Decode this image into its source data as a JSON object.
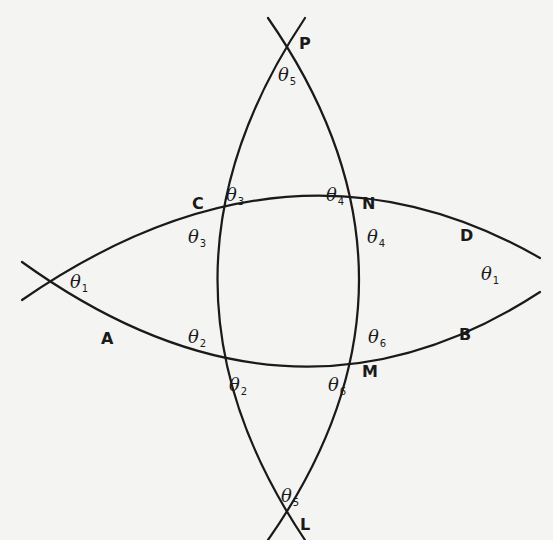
{
  "diagram": {
    "stroke_color": "#1a1a1a",
    "background": "#f4f4f2",
    "points": {
      "P": "P",
      "L": "L",
      "C": "C",
      "N": "N",
      "M": "M",
      "A": "A",
      "B": "B",
      "D": "D"
    },
    "angles": {
      "theta_symbol": "θ",
      "theta5_top": "5",
      "theta3_upper": "3",
      "theta4_upper": "4",
      "theta3_lower": "3",
      "theta4_lower": "4",
      "theta1_left": "1",
      "theta1_right": "1",
      "theta2_upper": "2",
      "theta6_upper": "6",
      "theta2_lower": "2",
      "theta6_lower": "6",
      "theta5_bottom": "5"
    }
  }
}
